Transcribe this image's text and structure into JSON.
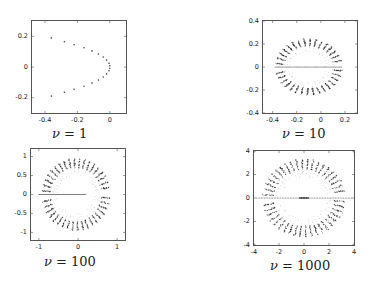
{
  "chart_data": [
    {
      "type": "scatter",
      "title": "",
      "caption_symbol": "ν",
      "caption_value": "= 1",
      "xlim": [
        -0.48,
        0.1
      ],
      "ylim": [
        -0.3,
        0.3
      ],
      "xticks": [
        -0.4,
        -0.2,
        0
      ],
      "xtick_labels": [
        "-0.4",
        "-0.2",
        "0"
      ],
      "yticks": [
        -0.2,
        0,
        0.2
      ],
      "ytick_labels": [
        "-0.2",
        "0",
        "0.2"
      ],
      "grid": false,
      "pattern": "parabola",
      "points": [
        [
          -0.36,
          0.19
        ],
        [
          -0.28,
          0.165
        ],
        [
          -0.22,
          0.145
        ],
        [
          -0.16,
          0.125
        ],
        [
          -0.11,
          0.105
        ],
        [
          -0.07,
          0.085
        ],
        [
          -0.04,
          0.065
        ],
        [
          -0.02,
          0.045
        ],
        [
          -0.005,
          0.025
        ],
        [
          0.0,
          0.008
        ],
        [
          0.0,
          -0.008
        ],
        [
          -0.005,
          -0.025
        ],
        [
          -0.02,
          -0.045
        ],
        [
          -0.04,
          -0.065
        ],
        [
          -0.07,
          -0.085
        ],
        [
          -0.11,
          -0.105
        ],
        [
          -0.16,
          -0.125
        ],
        [
          -0.22,
          -0.145
        ],
        [
          -0.28,
          -0.165
        ],
        [
          -0.36,
          -0.19
        ]
      ],
      "box": {
        "left": 31,
        "top": 20,
        "width": 96,
        "height": 94
      },
      "caption_pos": {
        "left": 52,
        "top": 126
      }
    },
    {
      "type": "scatter",
      "caption_symbol": "ν",
      "caption_value": "= 10",
      "xlim": [
        -0.48,
        0.3
      ],
      "ylim": [
        -0.4,
        0.4
      ],
      "xticks": [
        -0.4,
        -0.2,
        0,
        0.2
      ],
      "xtick_labels": [
        "-0.4",
        "-0.2",
        "0",
        "0.2"
      ],
      "yticks": [
        -0.4,
        -0.2,
        0,
        0.2,
        0.4
      ],
      "ytick_labels": [
        "-0.4",
        "-0.2",
        "0",
        "0.2",
        "0.4"
      ],
      "grid": false,
      "pattern": "ring",
      "ring": {
        "cx": -0.1,
        "cy": 0,
        "rx": 0.25,
        "ry": 0.22,
        "spokes": 34,
        "spoke_len": 0.07,
        "gap_left": true
      },
      "axis_line": {
        "from": -0.38,
        "to": 0.17
      },
      "box": {
        "left": 262,
        "top": 20,
        "width": 96,
        "height": 94
      },
      "caption_pos": {
        "left": 282,
        "top": 126
      }
    },
    {
      "type": "scatter",
      "caption_symbol": "ν",
      "caption_value": "= 100",
      "xlim": [
        -1.2,
        1.2
      ],
      "ylim": [
        -1.2,
        1.2
      ],
      "xticks": [
        -1,
        0,
        1
      ],
      "xtick_labels": [
        "-1",
        "0",
        "1"
      ],
      "yticks": [
        -1,
        -0.5,
        0,
        0.5,
        1
      ],
      "ytick_labels": [
        "-1",
        "-0.5",
        "0",
        "0.5",
        "1"
      ],
      "grid": false,
      "pattern": "ring",
      "ring": {
        "cx": -0.05,
        "cy": 0,
        "rx": 0.78,
        "ry": 0.85,
        "spokes": 40,
        "spoke_len": 0.22,
        "gap_left": false
      },
      "axis_line": {
        "from": -1.0,
        "to": 0.2
      },
      "box": {
        "left": 30,
        "top": 148,
        "width": 96,
        "height": 93
      },
      "caption_pos": {
        "left": 44,
        "top": 254
      }
    },
    {
      "type": "scatter",
      "caption_symbol": "ν",
      "caption_value": "= 1000",
      "xlim": [
        -4,
        4
      ],
      "ylim": [
        -4,
        4
      ],
      "xticks": [
        -4,
        -2,
        0,
        2,
        4
      ],
      "xtick_labels": [
        "-4",
        "-2",
        "0",
        "2",
        "4"
      ],
      "yticks": [
        -4,
        -2,
        0,
        2,
        4
      ],
      "ytick_labels": [
        "-4",
        "-2",
        "0",
        "2",
        "4"
      ],
      "grid": false,
      "pattern": "ring",
      "ring": {
        "cx": 0,
        "cy": 0,
        "rx": 2.9,
        "ry": 2.9,
        "spokes": 44,
        "spoke_len": 0.9,
        "gap_left": false
      },
      "axis_line": {
        "from": -3.8,
        "to": 3.8
      },
      "box": {
        "left": 253,
        "top": 150,
        "width": 102,
        "height": 96
      },
      "caption_pos": {
        "left": 270,
        "top": 258
      }
    }
  ]
}
